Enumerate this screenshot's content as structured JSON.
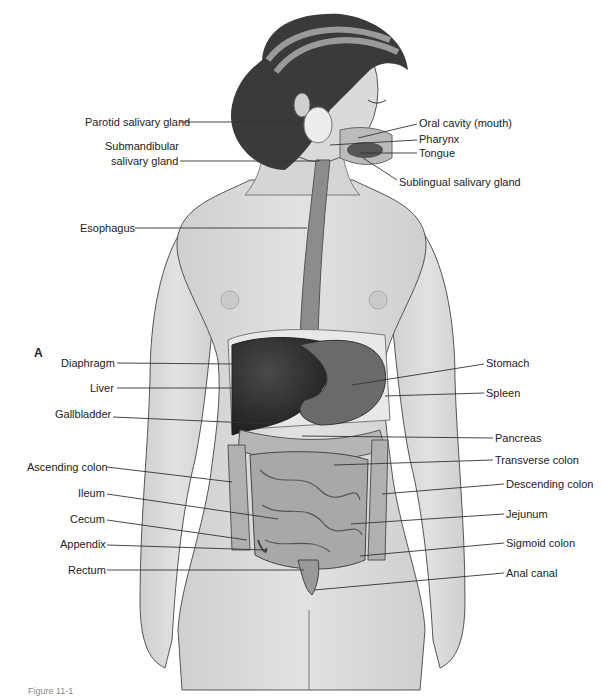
{
  "panel_letter": "A",
  "caption": "Figure 11-1",
  "labels_left": [
    {
      "id": "parotid",
      "text": "Parotid salivary gland",
      "x": 85,
      "y": 116,
      "lx1": 180,
      "ly1": 122,
      "lx2": 303,
      "ly2": 122
    },
    {
      "id": "submandibular-1",
      "text": "Submandibular",
      "x": 105,
      "y": 140
    },
    {
      "id": "submandibular-2",
      "text": "salivary gland",
      "x": 111,
      "y": 155,
      "lx1": 180,
      "ly1": 161,
      "lx2": 320,
      "ly2": 161
    },
    {
      "id": "esophagus",
      "text": "Esophagus",
      "x": 80,
      "y": 222,
      "lx1": 135,
      "ly1": 228,
      "lx2": 307,
      "ly2": 228
    },
    {
      "id": "diaphragm",
      "text": "Diaphragm",
      "x": 61,
      "y": 357,
      "lx1": 117,
      "ly1": 363,
      "lx2": 233,
      "ly2": 364
    },
    {
      "id": "liver",
      "text": "Liver",
      "x": 90,
      "y": 382,
      "lx1": 117,
      "ly1": 388,
      "lx2": 248,
      "ly2": 388
    },
    {
      "id": "gallbladder",
      "text": "Gallbladder",
      "x": 55,
      "y": 408,
      "lx1": 113,
      "ly1": 417,
      "lx2": 272,
      "ly2": 424
    },
    {
      "id": "ascending-colon",
      "text": "Ascending colon",
      "x": 27,
      "y": 461,
      "lx1": 107,
      "ly1": 467,
      "lx2": 232,
      "ly2": 482
    },
    {
      "id": "ileum",
      "text": "Ileum",
      "x": 78,
      "y": 487,
      "lx1": 107,
      "ly1": 494,
      "lx2": 278,
      "ly2": 519
    },
    {
      "id": "cecum",
      "text": "Cecum",
      "x": 70,
      "y": 513,
      "lx1": 107,
      "ly1": 520,
      "lx2": 247,
      "ly2": 540
    },
    {
      "id": "appendix",
      "text": "Appendix",
      "x": 60,
      "y": 538,
      "lx1": 107,
      "ly1": 545,
      "lx2": 266,
      "ly2": 550
    },
    {
      "id": "rectum",
      "text": "Rectum",
      "x": 68,
      "y": 564,
      "lx1": 107,
      "ly1": 570,
      "lx2": 304,
      "ly2": 570
    }
  ],
  "labels_right": [
    {
      "id": "oral-cavity",
      "text": "Oral cavity (mouth)",
      "x": 419,
      "y": 117,
      "lx1": 417,
      "ly1": 124,
      "lx2": 358,
      "ly2": 138
    },
    {
      "id": "pharynx",
      "text": "Pharynx",
      "x": 419,
      "y": 133,
      "lx1": 417,
      "ly1": 140,
      "lx2": 330,
      "ly2": 145
    },
    {
      "id": "tongue",
      "text": "Tongue",
      "x": 419,
      "y": 147,
      "lx1": 417,
      "ly1": 153,
      "lx2": 360,
      "ly2": 153
    },
    {
      "id": "sublingual",
      "text": "Sublingual salivary gland",
      "x": 399,
      "y": 176,
      "lx1": 397,
      "ly1": 180,
      "lx2": 363,
      "ly2": 158
    },
    {
      "id": "stomach",
      "text": "Stomach",
      "x": 486,
      "y": 357,
      "lx1": 484,
      "ly1": 364,
      "lx2": 352,
      "ly2": 385
    },
    {
      "id": "spleen",
      "text": "Spleen",
      "x": 486,
      "y": 387,
      "lx1": 484,
      "ly1": 393,
      "lx2": 385,
      "ly2": 396
    },
    {
      "id": "pancreas",
      "text": "Pancreas",
      "x": 495,
      "y": 432,
      "lx1": 493,
      "ly1": 438,
      "lx2": 302,
      "ly2": 436
    },
    {
      "id": "transverse-colon",
      "text": "Transverse colon",
      "x": 495,
      "y": 454,
      "lx1": 493,
      "ly1": 460,
      "lx2": 334,
      "ly2": 465
    },
    {
      "id": "descending-colon",
      "text": "Descending colon",
      "x": 506,
      "y": 478,
      "lx1": 504,
      "ly1": 484,
      "lx2": 382,
      "ly2": 494
    },
    {
      "id": "jejunum",
      "text": "Jejunum",
      "x": 506,
      "y": 508,
      "lx1": 504,
      "ly1": 514,
      "lx2": 351,
      "ly2": 524
    },
    {
      "id": "sigmoid-colon",
      "text": "Sigmoid colon",
      "x": 506,
      "y": 537,
      "lx1": 504,
      "ly1": 543,
      "lx2": 360,
      "ly2": 556
    },
    {
      "id": "anal-canal",
      "text": "Anal canal",
      "x": 506,
      "y": 567,
      "lx1": 504,
      "ly1": 573,
      "lx2": 314,
      "ly2": 590
    }
  ],
  "colors": {
    "skin": "#d9d9d9",
    "skin_shade": "#c4c4c4",
    "outline": "#555555",
    "hair": "#3a3a3a",
    "hairband": "#9a9a9a",
    "liver": "#2e2e2e",
    "stomach": "#6a6a6a",
    "intestine": "#a8a8a8",
    "colon": "#b5b5b5",
    "esophagus": "#8c8c8c",
    "leader_line": "#333333",
    "text": "#222222"
  }
}
